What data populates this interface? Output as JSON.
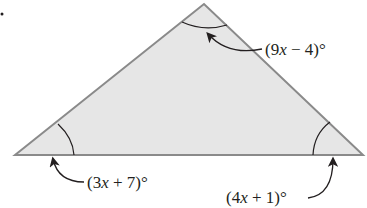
{
  "figure": {
    "type": "triangle",
    "fill_color": "#e6e6e6",
    "stroke_color": "#8a8a8a",
    "vertices": {
      "left": [
        15,
        155
      ],
      "apex": [
        204,
        4
      ],
      "right": [
        363,
        155
      ]
    },
    "angles": [
      {
        "vertex": "apex",
        "expr_pre": "(9",
        "var": "x",
        "expr_post": " − 4)°"
      },
      {
        "vertex": "left",
        "expr_pre": "(3",
        "var": "x",
        "expr_post": " + 7)°"
      },
      {
        "vertex": "right",
        "expr_pre": "(4",
        "var": "x",
        "expr_post": " + 1)°"
      }
    ]
  }
}
